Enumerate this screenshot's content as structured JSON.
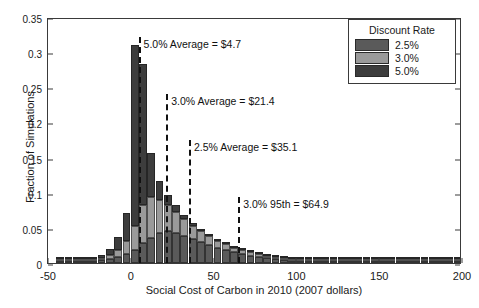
{
  "chart_data": {
    "type": "bar",
    "subtype": "stacked-histogram",
    "title": "",
    "xlabel": "Social Cost of Carbon in 2010 (2007 dollars)",
    "ylabel": "Fraction of Simulations",
    "xlim": [
      -50,
      200
    ],
    "ylim": [
      0,
      0.35
    ],
    "xticks": [
      "-50",
      "0",
      "50",
      "100",
      "150",
      "200"
    ],
    "xtick_values": [
      -50,
      0,
      50,
      100,
      150,
      200
    ],
    "yticks": [
      "0",
      "0.05",
      "0.1",
      "0.15",
      "0.2",
      "0.25",
      "0.3",
      "0.35"
    ],
    "ytick_values": [
      0,
      0.05,
      0.1,
      0.15,
      0.2,
      0.25,
      0.3,
      0.35
    ],
    "grid": false,
    "bin_width": 5,
    "bin_starts": [
      -45,
      -40,
      -35,
      -30,
      -25,
      -20,
      -15,
      -10,
      -5,
      0,
      5,
      10,
      15,
      20,
      25,
      30,
      35,
      40,
      45,
      50,
      55,
      60,
      65,
      70,
      75,
      80,
      85,
      90,
      95,
      100,
      105,
      110,
      115,
      120,
      125,
      130,
      135,
      140,
      145,
      150,
      155,
      160,
      165,
      170,
      175,
      180,
      185,
      190,
      195
    ],
    "legend_position": "top-right",
    "series": [
      {
        "name": "2.5%",
        "color": "#5a5a5a",
        "values": [
          0.0005,
          0.001,
          0.0015,
          0.002,
          0.003,
          0.004,
          0.006,
          0.009,
          0.013,
          0.019,
          0.028,
          0.036,
          0.042,
          0.045,
          0.043,
          0.039,
          0.034,
          0.03,
          0.026,
          0.022,
          0.019,
          0.016,
          0.014,
          0.012,
          0.01,
          0.009,
          0.008,
          0.007,
          0.006,
          0.005,
          0.0045,
          0.004,
          0.0035,
          0.003,
          0.0028,
          0.0025,
          0.0022,
          0.002,
          0.0018,
          0.0016,
          0.0014,
          0.0012,
          0.001,
          0.0009,
          0.0008,
          0.0007,
          0.0006,
          0.0005,
          0.0004
        ]
      },
      {
        "name": "3.0%",
        "color": "#9a9a9a",
        "values": [
          0.0004,
          0.0008,
          0.0013,
          0.0018,
          0.0026,
          0.0038,
          0.006,
          0.01,
          0.018,
          0.033,
          0.055,
          0.058,
          0.048,
          0.038,
          0.03,
          0.024,
          0.019,
          0.015,
          0.012,
          0.01,
          0.0085,
          0.007,
          0.006,
          0.005,
          0.0042,
          0.0036,
          0.0031,
          0.0027,
          0.0023,
          0.002,
          0.0017,
          0.0015,
          0.0013,
          0.0011,
          0.001,
          0.0009,
          0.0008,
          0.0007,
          0.0006,
          0.0005,
          0.00045,
          0.0004,
          0.00035,
          0.0003,
          0.00028,
          0.00025,
          0.00022,
          0.0002,
          0.00018
        ]
      },
      {
        "name": "5.0%",
        "color": "#3d3d3d",
        "values": [
          0.0003,
          0.0006,
          0.001,
          0.0015,
          0.0024,
          0.004,
          0.008,
          0.018,
          0.04,
          0.258,
          0.2,
          0.062,
          0.026,
          0.014,
          0.009,
          0.006,
          0.0045,
          0.0035,
          0.0028,
          0.0022,
          0.0018,
          0.0015,
          0.0013,
          0.0011,
          0.0009,
          0.0008,
          0.0007,
          0.0006,
          0.0005,
          0.00045,
          0.0004,
          0.00035,
          0.0003,
          0.00027,
          0.00025,
          0.00022,
          0.0002,
          0.00018,
          0.00016,
          0.00014,
          0.00012,
          0.0001,
          9e-05,
          8e-05,
          7e-05,
          6e-05,
          5e-05,
          4e-05,
          3e-05
        ]
      }
    ],
    "annotations": [
      {
        "id": "avg-5",
        "label": "5.0% Average = $4.7",
        "x": 4.7,
        "label_y": 0.315,
        "line_top": 0.322
      },
      {
        "id": "avg-3",
        "label": "3.0% Average = $21.4",
        "x": 21.4,
        "label_y": 0.233,
        "line_top": 0.24
      },
      {
        "id": "avg-25",
        "label": "2.5% Average = $35.1",
        "x": 35.1,
        "label_y": 0.168,
        "line_top": 0.175
      },
      {
        "id": "p95-3",
        "label": "3.0% 95th = $64.9",
        "x": 64.9,
        "label_y": 0.087,
        "line_top": 0.094
      }
    ]
  },
  "legend": {
    "title": "Discount Rate",
    "items": [
      {
        "label": "2.5%",
        "color": "#5a5a5a"
      },
      {
        "label": "3.0%",
        "color": "#9a9a9a"
      },
      {
        "label": "5.0%",
        "color": "#3d3d3d"
      }
    ]
  }
}
